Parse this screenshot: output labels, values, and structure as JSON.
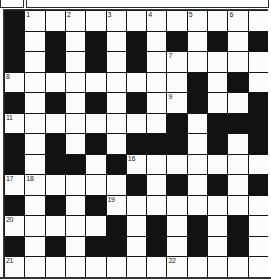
{
  "document": {
    "title": "Crossword Puzzle Grid",
    "type": "crossword"
  },
  "header": {
    "left_box_label": "",
    "right_box_label": ""
  },
  "grid": {
    "columns": 13,
    "rows": 13,
    "block_color": "#121212",
    "cell_color": "#fbfbfb",
    "border_color": "#333333",
    "highest_clue_number": 22,
    "clue_numbers": [
      1,
      2,
      3,
      4,
      5,
      6,
      7,
      8,
      9,
      10,
      11,
      12,
      13,
      14,
      15,
      16,
      17,
      18,
      19,
      20,
      21,
      22
    ],
    "legend": {
      "block": "#",
      "open": "."
    },
    "layout": [
      "#............",
      "#.#.#.#.#.#.#",
      "#.#.#.#......",
      ".........#.#.",
      "#.#.#.#..#..#",
      "........#.###",
      "#.#.#.###.#.#",
      "#.##.#.......",
      "......#.#.#.#",
      "#.#.#........",
      ".....#.#.#.#.",
      "#.#.##.#.#.#.",
      "............."
    ],
    "numbered_cells": [
      {
        "n": 1,
        "row": 0,
        "col": 1
      },
      {
        "n": 2,
        "row": 0,
        "col": 3
      },
      {
        "n": 3,
        "row": 0,
        "col": 5
      },
      {
        "n": 4,
        "row": 0,
        "col": 7
      },
      {
        "n": 5,
        "row": 0,
        "col": 9
      },
      {
        "n": 6,
        "row": 0,
        "col": 11
      },
      {
        "n": 7,
        "row": 2,
        "col": 8
      },
      {
        "n": 8,
        "row": 3,
        "col": 0
      },
      {
        "n": 9,
        "row": 4,
        "col": 8
      },
      {
        "n": 10,
        "row": 4,
        "col": 12
      },
      {
        "n": 11,
        "row": 5,
        "col": 0
      },
      {
        "n": 12,
        "row": 6,
        "col": 8
      },
      {
        "n": 13,
        "row": 6,
        "col": 10
      },
      {
        "n": 14,
        "row": 7,
        "col": 3
      },
      {
        "n": 15,
        "row": 7,
        "col": 5
      },
      {
        "n": 16,
        "row": 7,
        "col": 6
      },
      {
        "n": 17,
        "row": 8,
        "col": 0
      },
      {
        "n": 18,
        "row": 8,
        "col": 1
      },
      {
        "n": 19,
        "row": 9,
        "col": 5
      },
      {
        "n": 20,
        "row": 10,
        "col": 0
      },
      {
        "n": 21,
        "row": 12,
        "col": 0
      },
      {
        "n": 22,
        "row": 12,
        "col": 8
      }
    ],
    "entries": []
  }
}
